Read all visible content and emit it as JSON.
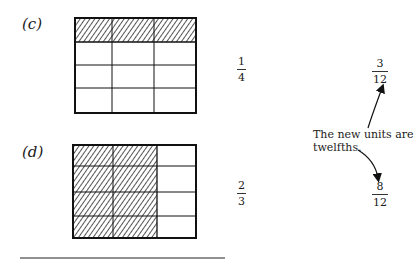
{
  "figure_c": {
    "label": "(c)",
    "grid": {
      "rows": 4,
      "cols": 3,
      "shaded_rows": [
        0
      ],
      "shaded_cols": null
    },
    "fraction": {
      "numerator": "1",
      "denominator": "4"
    },
    "equivalent": {
      "numerator": "3",
      "denominator": "12"
    }
  },
  "figure_d": {
    "label": "(d)",
    "grid": {
      "rows": 4,
      "cols": 3,
      "shaded_rows": null,
      "shaded_cols": [
        0,
        1
      ]
    },
    "fraction": {
      "numerator": "2",
      "denominator": "3"
    },
    "equivalent": {
      "numerator": "8",
      "denominator": "12"
    }
  },
  "annotation": {
    "line1": "The new units are",
    "line2": "twelfths."
  },
  "colors": {
    "ink": "#1a1a1a",
    "hatch": "#555555"
  }
}
